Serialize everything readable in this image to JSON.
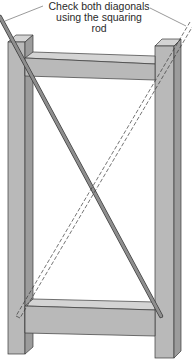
{
  "figure": {
    "type": "technical-illustration",
    "annotation": {
      "lines": [
        "Check both diagonals",
        "using the squaring",
        "rod"
      ]
    },
    "elements": {
      "left_post": "vertical post",
      "right_post": "vertical post",
      "top_rail": "horizontal rail",
      "bottom_rail": "horizontal rail",
      "rod_solid": "squaring rod (first diagonal)",
      "rod_dashed": "squaring rod (second diagonal, dashed)"
    },
    "colors": {
      "wood_front": "#b9b9b9",
      "wood_side": "#9c9c9c",
      "wood_top": "#d4d4d4",
      "outline": "#3a3a3a",
      "rod": "#8e8e8e",
      "background": "#ffffff"
    }
  }
}
